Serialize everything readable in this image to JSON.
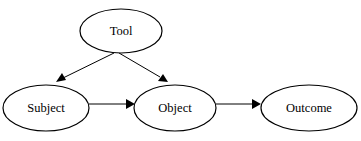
{
  "diagram": {
    "nodes": [
      {
        "id": "tool",
        "label": "Tool",
        "cx": 121,
        "cy": 31,
        "rx": 41,
        "ry": 22
      },
      {
        "id": "subject",
        "label": "Subject",
        "cx": 46,
        "cy": 108,
        "rx": 43,
        "ry": 23
      },
      {
        "id": "object",
        "label": "Object",
        "cx": 175,
        "cy": 108,
        "rx": 41,
        "ry": 23
      },
      {
        "id": "outcome",
        "label": "Outcome",
        "cx": 309,
        "cy": 108,
        "rx": 48,
        "ry": 23
      }
    ],
    "edges": [
      {
        "from": "tool",
        "to": "subject"
      },
      {
        "from": "tool",
        "to": "object"
      },
      {
        "from": "subject",
        "to": "object"
      },
      {
        "from": "object",
        "to": "outcome"
      }
    ]
  }
}
